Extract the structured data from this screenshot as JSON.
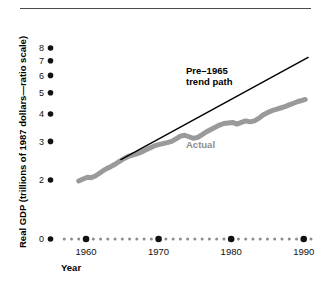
{
  "figure": {
    "top_rule": true,
    "background": "#ffffff",
    "ink_color": "#111111"
  },
  "chart_data": {
    "type": "line",
    "title": "",
    "subtitle": "",
    "xlabel": "Year",
    "ylabel": "Real GDP (trillions of 1987 dollars—ratio scale)",
    "yscale": "log (ratio scale)",
    "grid": false,
    "legend_position": "inline-annotation",
    "xlim": [
      1956,
      1991
    ],
    "ylim": [
      1.85,
      8.6
    ],
    "y_tick_labels": [
      "8",
      "7",
      "6",
      "5",
      "4",
      "3",
      "2",
      "0"
    ],
    "y_tick_values": [
      8,
      7,
      6,
      5,
      4,
      3,
      2,
      0
    ],
    "x_tick_labels": [
      "1960",
      "1970",
      "1980",
      "1990"
    ],
    "x_tick_values": [
      1960,
      1970,
      1980,
      1990
    ],
    "x_minor_ticks": [
      1957,
      1958,
      1959,
      1961,
      1962,
      1963,
      1964,
      1965,
      1966,
      1967,
      1968,
      1969,
      1971,
      1972,
      1973,
      1974,
      1975,
      1976,
      1977,
      1978,
      1979,
      1981,
      1982,
      1983,
      1984,
      1985,
      1986,
      1987,
      1988,
      1989,
      1991
    ],
    "annotations": [
      {
        "name": "trend-path-label",
        "text_line1": "Pre–1965",
        "text_line2": "trend path",
        "color": "#000000",
        "x": 186,
        "y": 75
      },
      {
        "name": "actual-label",
        "text": "Actual",
        "color": "#8d8d8d",
        "x": 186,
        "y": 146
      }
    ],
    "series": [
      {
        "name": "Actual",
        "style": "thick-gray",
        "color": "#9a9a9a",
        "width": 5,
        "x": [
          1959.0,
          1959.6,
          1960.2,
          1960.7,
          1961.2,
          1961.7,
          1962.3,
          1962.9,
          1963.4,
          1964.0,
          1964.6,
          1965.2,
          1965.8,
          1966.4,
          1967.0,
          1967.6,
          1968.2,
          1968.8,
          1969.4,
          1970.0,
          1970.6,
          1971.2,
          1971.8,
          1972.4,
          1973.0,
          1973.6,
          1974.2,
          1974.8,
          1975.4,
          1976.0,
          1976.6,
          1977.2,
          1977.8,
          1978.4,
          1979.0,
          1979.6,
          1980.2,
          1980.8,
          1981.4,
          1982.0,
          1982.6,
          1983.2,
          1983.8,
          1984.4,
          1985.0,
          1985.6,
          1986.2,
          1986.8,
          1987.4,
          1988.0,
          1988.6,
          1989.2,
          1989.8,
          1990.2
        ],
        "values": [
          1.98,
          2.02,
          2.06,
          2.05,
          2.08,
          2.13,
          2.2,
          2.26,
          2.3,
          2.36,
          2.43,
          2.5,
          2.56,
          2.6,
          2.63,
          2.68,
          2.74,
          2.8,
          2.86,
          2.9,
          2.93,
          2.96,
          3.0,
          3.08,
          3.17,
          3.2,
          3.15,
          3.1,
          3.13,
          3.22,
          3.32,
          3.4,
          3.48,
          3.56,
          3.62,
          3.64,
          3.66,
          3.6,
          3.66,
          3.72,
          3.68,
          3.72,
          3.82,
          3.96,
          4.06,
          4.14,
          4.2,
          4.26,
          4.32,
          4.4,
          4.48,
          4.56,
          4.62,
          4.66
        ]
      },
      {
        "name": "Pre-1965 trend path",
        "style": "thin-black",
        "color": "#000000",
        "width": 1.4,
        "x": [
          1964.8,
          1990.6
        ],
        "values": [
          2.48,
          7.25
        ]
      }
    ]
  },
  "axis": {
    "y_label": "Real GDP (trillions of 1987 dollars—ratio scale)",
    "x_label": "Year"
  }
}
